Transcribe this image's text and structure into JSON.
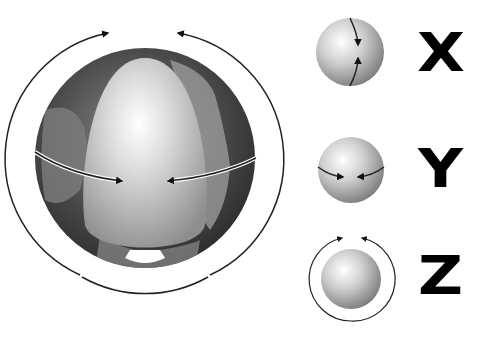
{
  "diagram": {
    "main_globe": {
      "description": "Earth globe with cutaway showing inner egg-shaped core, equatorial arrows converging and encircling rotation arrows"
    },
    "axes": [
      {
        "label": "X",
        "description": "sphere with vertical meridian arrows converging"
      },
      {
        "label": "Y",
        "description": "sphere with horizontal equator arrows converging"
      },
      {
        "label": "Z",
        "description": "sphere with encircling rotation arrows"
      }
    ]
  },
  "colors": {
    "background": "#ffffff",
    "ink": "#000000",
    "sphere_light": "#f2f2f2",
    "sphere_dark": "#6e6e6e",
    "globe_dark": "#3a3a3a"
  }
}
